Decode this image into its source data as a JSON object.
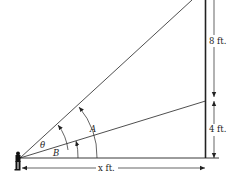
{
  "diagram": {
    "type": "angle-of-elevation",
    "labels": {
      "upper_segment": "8 ft.",
      "lower_segment": "4 ft.",
      "horizontal_distance": "x ft.",
      "angle_theta": "θ",
      "angle_A": "A",
      "angle_B": "B"
    },
    "colors": {
      "line": "#222222",
      "background": "#ffffff"
    }
  }
}
